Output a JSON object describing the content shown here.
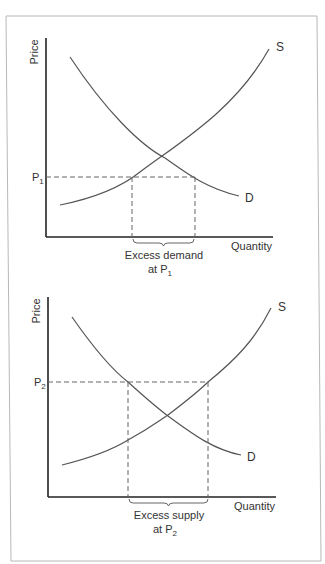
{
  "diagrams": [
    {
      "id": "excess-demand",
      "y_axis_label": "Price",
      "x_axis_label": "Quantity",
      "supply_label": "S",
      "demand_label": "D",
      "price_label": "P",
      "price_subscript": "1",
      "annotation_line1": "Excess demand",
      "annotation_line2_prefix": "at P",
      "annotation_line2_subscript": "1"
    },
    {
      "id": "excess-supply",
      "y_axis_label": "Price",
      "x_axis_label": "Quantity",
      "supply_label": "S",
      "demand_label": "D",
      "price_label": "P",
      "price_subscript": "2",
      "annotation_line1": "Excess supply",
      "annotation_line2_prefix": "at P",
      "annotation_line2_subscript": "2"
    }
  ],
  "colors": {
    "frame": "#b8b8b8",
    "axis": "#222222",
    "curve": "#555555",
    "dashed": "#666666",
    "text": "#333333"
  }
}
